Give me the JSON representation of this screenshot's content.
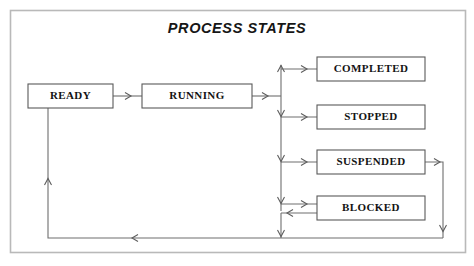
{
  "diagram": {
    "title": "PROCESS STATES",
    "type": "state-transition-diagram",
    "background_color": "#ffffff",
    "frame_color": "#b9b9b9",
    "box_border_color": "#5a5a5a",
    "edge_color": "#6e6e6e",
    "text_color": "#131313",
    "states": [
      {
        "id": "ready",
        "label": "READY",
        "x": 28,
        "y": 84,
        "w": 85,
        "h": 24
      },
      {
        "id": "running",
        "label": "RUNNING",
        "x": 142,
        "y": 84,
        "w": 110,
        "h": 24
      },
      {
        "id": "completed",
        "label": "COMPLETED",
        "x": 317,
        "y": 57,
        "w": 108,
        "h": 24
      },
      {
        "id": "stopped",
        "label": "STOPPED",
        "x": 317,
        "y": 105,
        "w": 108,
        "h": 24
      },
      {
        "id": "suspended",
        "label": "SUSPENDED",
        "x": 317,
        "y": 150,
        "w": 108,
        "h": 24
      },
      {
        "id": "blocked",
        "label": "BLOCKED",
        "x": 317,
        "y": 196,
        "w": 108,
        "h": 24
      }
    ],
    "transitions": [
      {
        "id": "ready-to-running",
        "from": "ready",
        "to": "running"
      },
      {
        "id": "running-to-branch",
        "from": "running",
        "to": "branch-spine"
      },
      {
        "id": "branch-to-completed",
        "from": "branch-spine",
        "to": "completed"
      },
      {
        "id": "branch-to-stopped",
        "from": "branch-spine",
        "to": "stopped"
      },
      {
        "id": "branch-to-suspended",
        "from": "branch-spine",
        "to": "suspended"
      },
      {
        "id": "branch-to-blocked",
        "from": "branch-spine",
        "to": "blocked"
      },
      {
        "id": "blocked-to-branch",
        "from": "blocked",
        "to": "branch-spine"
      },
      {
        "id": "suspended-to-ready",
        "from": "suspended",
        "to": "ready"
      },
      {
        "id": "branch-to-ready",
        "from": "branch-spine",
        "to": "ready"
      }
    ]
  }
}
